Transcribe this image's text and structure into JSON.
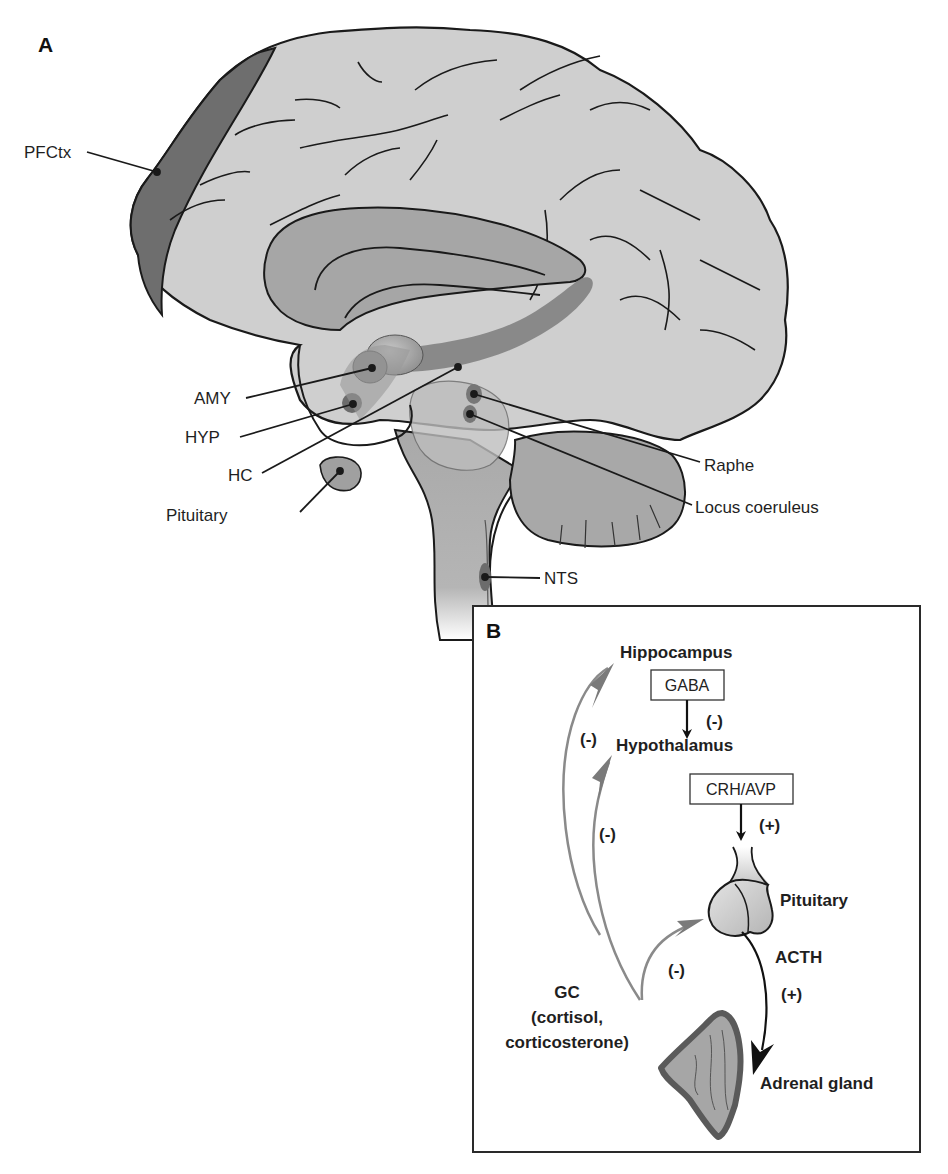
{
  "figure": {
    "top_cut_text": "",
    "panel_a": {
      "label": "A",
      "regions": [
        {
          "id": "pfctx",
          "label": "PFCtx",
          "name": "Prefrontal cortex"
        },
        {
          "id": "amy",
          "label": "AMY",
          "name": "Amygdala"
        },
        {
          "id": "hyp",
          "label": "HYP",
          "name": "Hypothalamus"
        },
        {
          "id": "hc",
          "label": "HC",
          "name": "Hippocampus"
        },
        {
          "id": "pituitary",
          "label": "Pituitary",
          "name": "Pituitary"
        },
        {
          "id": "raphe",
          "label": "Raphe",
          "name": "Raphe nuclei"
        },
        {
          "id": "lc",
          "label": "Locus coeruleus",
          "name": "Locus coeruleus"
        },
        {
          "id": "nts",
          "label": "NTS",
          "name": "Nucleus tractus solitarius"
        }
      ]
    },
    "panel_b": {
      "label": "B",
      "nodes": {
        "hippocampus": "Hippocampus",
        "hypothalamus": "Hypothalamus",
        "pituitary": "Pituitary",
        "adrenal": "Adrenal gland"
      },
      "boxes": {
        "gaba": "GABA",
        "crh_avp": "CRH/AVP"
      },
      "signs": {
        "gaba_effect": "(-)",
        "crh_effect": "(+)",
        "acth_effect": "(+)",
        "gc_to_hippocampus": "(-)",
        "gc_to_hypothalamus": "(-)",
        "gc_to_pituitary": "(-)"
      },
      "hormones": {
        "acth": "ACTH",
        "gc_line1": "GC",
        "gc_line2": "(cortisol,",
        "gc_line3": "corticosterone)"
      }
    },
    "colors": {
      "cortex": "#cfcfcf",
      "pfc": "#6e6e6e",
      "limbic": "#9a9a9a",
      "nucleus": "#7a7a7a",
      "brainstem": "#a9a9a9",
      "feedback_arrow": "#8a8a8a",
      "outline": "#1a1a1a",
      "adrenal_rim": "#5a5a5a",
      "adrenal_fill": "#a6a6a6"
    }
  }
}
